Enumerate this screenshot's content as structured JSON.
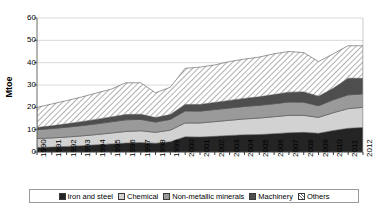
{
  "chart_data": {
    "type": "area",
    "stacked": true,
    "title": "",
    "subtitle": "",
    "xlabel": "",
    "ylabel": "Mtoe",
    "ylim": [
      0,
      60
    ],
    "yticks": [
      0,
      10,
      20,
      30,
      40,
      50,
      60
    ],
    "grid": true,
    "grid_axis": "y",
    "legend_position": "bottom",
    "x": [
      "1990",
      "1991",
      "1992",
      "1993",
      "1994",
      "1995",
      "1996",
      "1997",
      "1998",
      "1999",
      "2000",
      "2001",
      "2002",
      "2003",
      "2004",
      "2005",
      "2006",
      "2007",
      "2008",
      "2009",
      "2010",
      "2011",
      "2012"
    ],
    "categories": [
      "1990",
      "1991",
      "1992",
      "1993",
      "1994",
      "1995",
      "1996",
      "1997",
      "1998",
      "1999",
      "2000",
      "2001",
      "2002",
      "2003",
      "2004",
      "2005",
      "2006",
      "2007",
      "2008",
      "2009",
      "2010",
      "2011",
      "2012"
    ],
    "series": [
      {
        "name": "Iron and steel",
        "color": "#242424",
        "pattern": "solid",
        "values": [
          2.0,
          2.2,
          2.5,
          2.8,
          3.2,
          3.6,
          4.0,
          4.2,
          3.9,
          4.6,
          6.8,
          6.7,
          7.0,
          7.4,
          7.7,
          7.8,
          8.2,
          8.6,
          8.8,
          8.4,
          9.6,
          10.6,
          11.0
        ]
      },
      {
        "name": "Chemical",
        "color": "#d2d2d2",
        "pattern": "solid",
        "values": [
          4.0,
          4.1,
          4.2,
          4.4,
          4.6,
          4.9,
          5.2,
          5.3,
          4.9,
          5.2,
          6.2,
          6.3,
          6.6,
          6.8,
          7.1,
          7.4,
          7.6,
          7.8,
          7.6,
          7.1,
          8.0,
          8.8,
          9.0
        ]
      },
      {
        "name": "Non-metallic minerals",
        "color": "#9a9a9a",
        "pattern": "solid",
        "values": [
          4.0,
          4.2,
          4.4,
          4.6,
          4.8,
          5.0,
          5.2,
          5.1,
          4.6,
          4.8,
          5.4,
          5.3,
          5.4,
          5.5,
          5.6,
          5.7,
          5.8,
          6.0,
          5.9,
          5.2,
          5.8,
          6.2,
          6.0
        ]
      },
      {
        "name": "Machinery",
        "color": "#4e4e4e",
        "pattern": "solid",
        "values": [
          1.0,
          1.2,
          1.5,
          1.8,
          2.0,
          2.2,
          2.4,
          2.3,
          2.0,
          2.2,
          2.9,
          3.0,
          3.2,
          3.4,
          3.6,
          3.8,
          4.1,
          4.4,
          4.6,
          4.3,
          5.2,
          7.4,
          7.0
        ]
      },
      {
        "name": "Others",
        "color": "#ffffff",
        "pattern": "diagonal-hatch",
        "values": [
          9.0,
          9.8,
          10.4,
          11.0,
          11.8,
          12.4,
          14.2,
          14.1,
          11.1,
          12.2,
          16.2,
          16.7,
          16.8,
          17.4,
          17.6,
          17.8,
          18.3,
          18.2,
          17.6,
          15.5,
          15.4,
          14.6,
          14.6
        ]
      }
    ],
    "totals_by_year": [
      20.0,
      21.5,
      23.0,
      24.6,
      26.4,
      28.1,
      31.0,
      31.0,
      26.5,
      29.0,
      37.5,
      38.0,
      39.0,
      40.5,
      41.6,
      42.5,
      44.0,
      45.0,
      44.5,
      40.5,
      44.0,
      47.6,
      47.6
    ]
  },
  "legend": {
    "items": [
      {
        "label": "Iron and steel",
        "swatch": "iron-and-steel-swatch"
      },
      {
        "label": "Chemical",
        "swatch": "chemical-swatch"
      },
      {
        "label": "Non-metallic minerals",
        "swatch": "non-metallic-minerals-swatch"
      },
      {
        "label": "Machinery",
        "swatch": "machinery-swatch"
      },
      {
        "label": "Others",
        "swatch": "others-swatch"
      }
    ]
  }
}
